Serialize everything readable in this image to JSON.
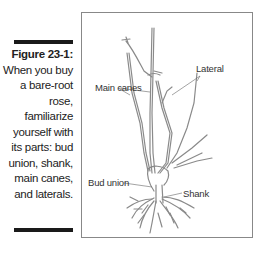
{
  "caption": {
    "figure_label": "Figure 23-1:",
    "text": "When you buy a bare-root rose, familiarize yourself with its parts: bud union, shank, main canes, and laterals."
  },
  "illustration": {
    "subject": "bare-root rose",
    "callouts": {
      "main_canes": "Main canes",
      "lateral": "Lateral",
      "bud_union": "Bud union",
      "shank": "Shank"
    }
  }
}
